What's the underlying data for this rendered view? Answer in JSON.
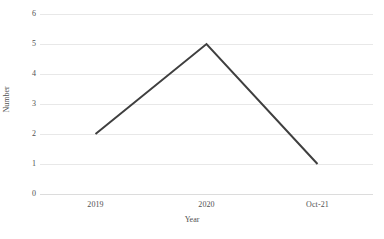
{
  "chart_data": {
    "type": "line",
    "title": "",
    "categories": [
      "2019",
      "2020",
      "Oct-21"
    ],
    "values": [
      2,
      5,
      1
    ],
    "series": [
      {
        "name": "Number",
        "values": [
          2,
          5,
          1
        ]
      }
    ],
    "xlabel": "Year",
    "ylabel": "Number",
    "ylim": [
      0,
      6
    ],
    "yticks": [
      0,
      1,
      2,
      3,
      4,
      5,
      6
    ],
    "ytick_labels": [
      "0",
      "1",
      "2",
      "3",
      "4",
      "5",
      "6"
    ],
    "xtick_labels": [
      "2019",
      "2020",
      "Oct-21"
    ],
    "grid": "horizontal",
    "legend": "none",
    "line_color": "#3f3f3f",
    "line_width": 2,
    "markers": "none",
    "gridline_color": "#e8e8e8",
    "background_color": "#ffffff",
    "text_color": "#505050"
  }
}
